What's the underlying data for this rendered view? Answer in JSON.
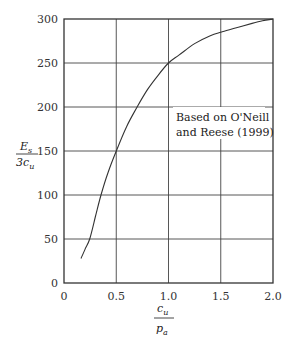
{
  "chart_data": {
    "type": "line",
    "title": "",
    "xlabel": "c_u / p_a",
    "ylabel": "E_s / 3c_u",
    "xlabel_parts": {
      "num": "c",
      "num_sub": "u",
      "den": "p",
      "den_sub": "a"
    },
    "ylabel_parts": {
      "num": "E",
      "num_sub": "s",
      "den": "3c",
      "den_sub": "u"
    },
    "xlim": [
      0,
      2.0
    ],
    "ylim": [
      0,
      300
    ],
    "xticks": [
      0,
      0.5,
      1.0,
      1.5,
      2.0
    ],
    "xtick_labels": [
      "0",
      "0.5",
      "1.0",
      "1.5",
      "2.0"
    ],
    "yticks": [
      0,
      50,
      100,
      150,
      200,
      250,
      300
    ],
    "ytick_labels": [
      "0",
      "50",
      "100",
      "150",
      "200",
      "250",
      "300"
    ],
    "grid": true,
    "legend": null,
    "annotation": {
      "line1": "Based on O'Neill",
      "line2": "and Reese (1999)",
      "x": 1.07,
      "y": 186
    },
    "series": [
      {
        "name": "Es/3cu vs cu/pa",
        "x": [
          0.163,
          0.2,
          0.246,
          0.3,
          0.354,
          0.42,
          0.5,
          0.6,
          0.7,
          0.8,
          0.9,
          1.0,
          1.1,
          1.25,
          1.4,
          1.5,
          1.65,
          1.8,
          1.9,
          2.0
        ],
        "y": [
          28,
          38,
          50,
          75,
          100,
          125,
          150,
          178,
          200,
          220,
          236,
          250,
          259,
          272,
          281,
          285,
          290,
          295,
          298,
          300
        ]
      }
    ]
  }
}
